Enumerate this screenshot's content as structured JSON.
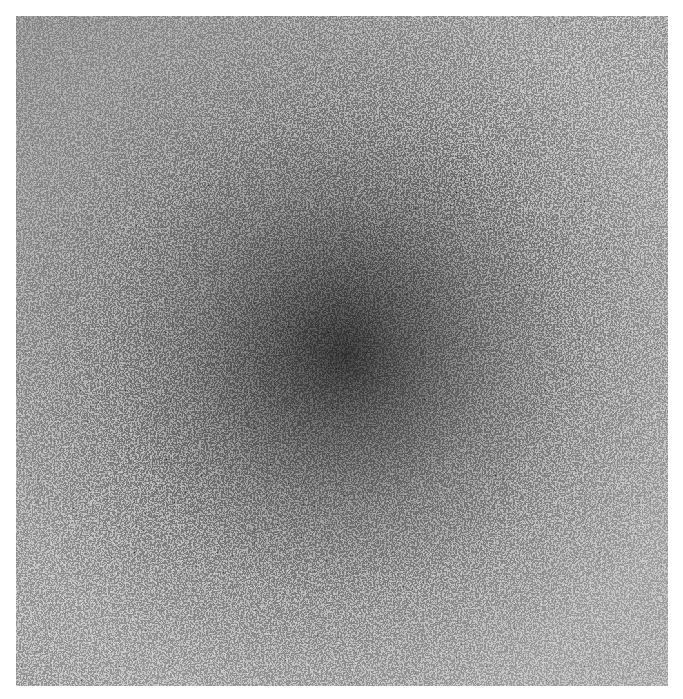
{
  "image": {
    "description": "Grayscale stippled noise texture with darker radial center",
    "colors": {
      "background": "#ffffff",
      "center_dark": "#2e2e2e",
      "mid": "#6a6a6a",
      "edge_light": "#9a9a9a"
    }
  }
}
